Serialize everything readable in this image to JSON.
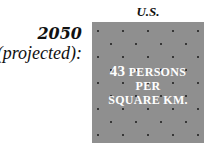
{
  "row_label": {
    "year": "2050",
    "qualifier": "(projected):"
  },
  "column": {
    "title": "U.S."
  },
  "density_box": {
    "number": "43",
    "line1_rest": "PERSONS",
    "line2": "PER",
    "line3": "SQUARE KM.",
    "fill_color": "#8f8f8f",
    "dot_color": "#1a1a1a",
    "text_color": "#ffffff"
  }
}
